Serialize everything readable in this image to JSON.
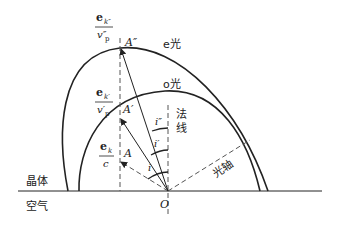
{
  "diagram": {
    "regions": {
      "crystal": "晶体",
      "air": "空气"
    },
    "waves": {
      "e_wave": "e光",
      "o_wave": "o光"
    },
    "normal_label_1": "法",
    "normal_label_2": "线",
    "optic_axis": "光轴",
    "origin": "O",
    "points": {
      "A": "A",
      "A_prime": "A′",
      "A_double_prime": "A″"
    },
    "angles": {
      "i": "i",
      "i_prime": "i′",
      "i_double_prime": "i″"
    },
    "fractions": {
      "f1": {
        "num": "e",
        "num_sub": "k″",
        "den": "v″",
        "den_sub": "p"
      },
      "f2": {
        "num": "e",
        "num_sub": "k′",
        "den": "v′",
        "den_sub": "p"
      },
      "f3": {
        "num": "e",
        "num_sub": "k",
        "den": "c",
        "den_sub": ""
      }
    },
    "colors": {
      "line": "#222222",
      "dashed": "#555555"
    }
  }
}
